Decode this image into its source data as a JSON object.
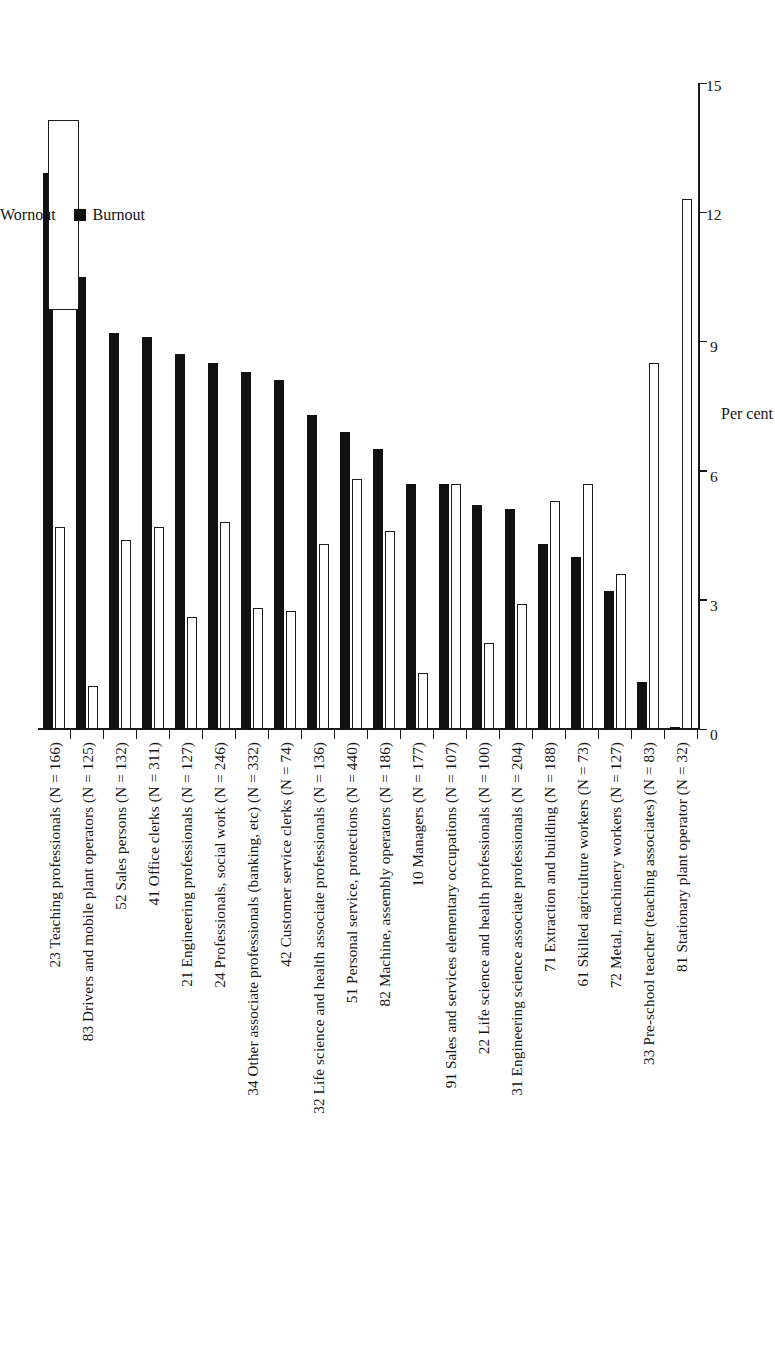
{
  "figure": {
    "background_color": "#ffffff",
    "orientation": "rotated-90",
    "axis_title": "Per cent",
    "legend": {
      "position": "top-right",
      "entries": [
        {
          "label": "Wornout",
          "swatch": "open-square",
          "color": "#ffffff"
        },
        {
          "label": "Burnout",
          "swatch": "filled-square",
          "color": "#111111"
        }
      ]
    }
  },
  "chart_data": {
    "type": "bar",
    "title": "",
    "subtitle": "",
    "xlabel": "Per cent",
    "ylabel": "",
    "orientation": "horizontal",
    "grid": false,
    "legend_position": "top-right",
    "xlim": [
      0,
      15
    ],
    "xticks": [
      0,
      3,
      6,
      9,
      12,
      15
    ],
    "xtick_labels": [
      "0",
      "3",
      "6",
      "9",
      "12",
      "15"
    ],
    "categories": [
      "23 Teaching professionals (N = 166)",
      "83 Drivers and mobile plant operators (N = 125)",
      "52 Sales persons (N = 132)",
      "41 Office clerks (N = 311)",
      "21 Engineering professionals (N = 127)",
      "24 Professionals, social work (N = 246)",
      "34 Other associate professionals (banking, etc) (N = 332)",
      "42 Customer service clerks (N = 74)",
      "32 Life science and health associate professionals (N = 136)",
      "51 Personal service, protections (N = 440)",
      "82 Machine, assembly operators (N = 186)",
      "10 Managers (N = 177)",
      "91 Sales and services elementary occupations (N = 107)",
      "22 Life science and health professionals (N = 100)",
      "31 Engineering science associate professionals (N = 204)",
      "71 Extraction and building (N = 188)",
      "61 Skilled agriculture workers (N = 73)",
      "72 Metal, machinery workers (N = 127)",
      "33 Pre-school teacher (teaching associates) (N = 83)",
      "81 Stationary plant operator (N = 32)"
    ],
    "series": [
      {
        "name": "Burnout",
        "color": "#111111",
        "style": "filled",
        "values": [
          12.9,
          10.5,
          9.2,
          9.1,
          8.7,
          8.5,
          8.3,
          8.1,
          7.3,
          6.9,
          6.5,
          5.7,
          5.7,
          5.2,
          5.1,
          4.3,
          4.0,
          3.2,
          1.1,
          0.05
        ]
      },
      {
        "name": "Wornout",
        "color": "#ffffff",
        "style": "open",
        "values": [
          4.7,
          1.0,
          4.4,
          4.7,
          2.6,
          4.8,
          2.8,
          2.75,
          4.3,
          5.8,
          4.6,
          1.3,
          5.7,
          2.0,
          2.9,
          5.3,
          5.7,
          3.6,
          8.5,
          12.3
        ]
      }
    ],
    "units": "per cent"
  }
}
